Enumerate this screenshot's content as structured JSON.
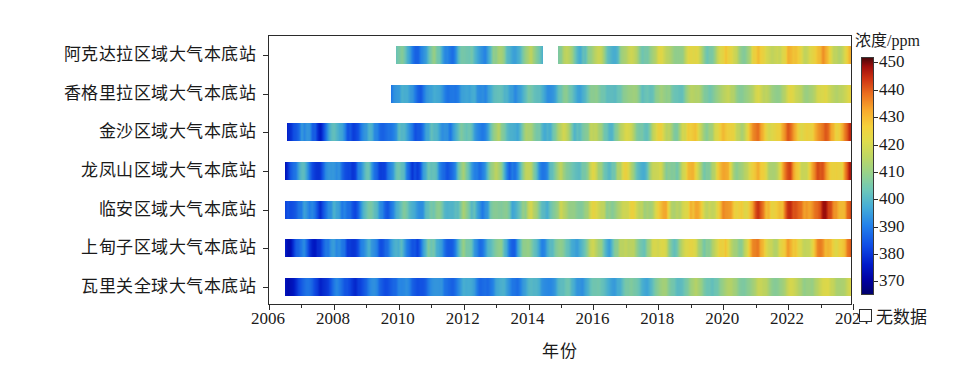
{
  "chart_data": {
    "type": "heatmap",
    "title": "",
    "xlabel": "年份",
    "ylabel": "",
    "xlim": [
      2006,
      2024
    ],
    "xticks": [
      2006,
      2008,
      2010,
      2012,
      2014,
      2016,
      2018,
      2020,
      2022,
      2024
    ],
    "xticklabels": [
      "2006",
      "2008",
      "2010",
      "2012",
      "2014",
      "2016",
      "2018",
      "2020",
      "2022",
      "2024"
    ],
    "xminor_ticks": [
      2007,
      2009,
      2011,
      2013,
      2015,
      2017,
      2019,
      2021,
      2023
    ],
    "grid": false,
    "colorbar": {
      "title": "浓度/ppm",
      "unit": "ppm",
      "vmin": 365,
      "vmax": 452,
      "ticks": [
        370,
        380,
        390,
        400,
        410,
        420,
        430,
        440,
        450
      ],
      "ticklabels": [
        "370",
        "380",
        "390",
        "400",
        "410",
        "420",
        "430",
        "440",
        "450"
      ],
      "colormap": "jet",
      "position": "right",
      "nodata_label": "无数据",
      "nodata_color": "#ffffff"
    },
    "categories": [
      "阿克达拉区域大气本底站",
      "香格里拉区域大气本底站",
      "金沙区域大气本底站",
      "龙凤山区域大气本底站",
      "临安区域大气本底站",
      "上甸子区域大气本底站",
      "瓦里关全球大气本底站"
    ],
    "series": [
      {
        "name": "阿克达拉区域大气本底站",
        "coverage": [
          [
            2009.9,
            2014.45
          ],
          [
            2014.9,
            2024.0
          ]
        ],
        "start_value": 388,
        "end_value": 428,
        "seasonal_amplitude": 9.0,
        "noise": 3.4,
        "seasonal_phase": 0.08
      },
      {
        "name": "香格里拉区域大气本底站",
        "coverage": [
          [
            2009.75,
            2024.0
          ]
        ],
        "start_value": 385,
        "end_value": 421,
        "seasonal_amplitude": 5.0,
        "noise": 2.4,
        "seasonal_phase": 0.12
      },
      {
        "name": "金沙区域大气本底站",
        "coverage": [
          [
            2006.55,
            2024.0
          ]
        ],
        "start_value": 384,
        "end_value": 436,
        "seasonal_amplitude": 8.5,
        "noise": 4.0,
        "seasonal_phase": 0.05
      },
      {
        "name": "龙凤山区域大气本底站",
        "coverage": [
          [
            2006.5,
            2024.0
          ]
        ],
        "start_value": 382,
        "end_value": 433,
        "seasonal_amplitude": 11.0,
        "noise": 4.2,
        "seasonal_phase": 0.0
      },
      {
        "name": "临安区域大气本底站",
        "coverage": [
          [
            2006.5,
            2024.0
          ]
        ],
        "start_value": 385,
        "end_value": 442,
        "seasonal_amplitude": 7.5,
        "noise": 4.6,
        "seasonal_phase": 0.1
      },
      {
        "name": "上甸子区域大气本底站",
        "coverage": [
          [
            2006.5,
            2024.0
          ]
        ],
        "start_value": 383,
        "end_value": 432,
        "seasonal_amplitude": 9.5,
        "noise": 4.0,
        "seasonal_phase": 0.02
      },
      {
        "name": "瓦里关全球大气本底站",
        "coverage": [
          [
            2006.5,
            2024.0
          ]
        ],
        "start_value": 380,
        "end_value": 419,
        "seasonal_amplitude": 5.5,
        "noise": 2.0,
        "seasonal_phase": 0.15
      }
    ]
  }
}
